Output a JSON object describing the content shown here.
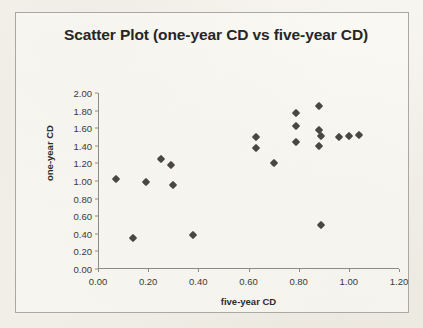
{
  "chart_data": {
    "type": "scatter",
    "title": "Scatter Plot (one-year CD vs five-year CD)",
    "xlabel": "five-year CD",
    "ylabel": "one-year CD",
    "xlim": [
      0.0,
      1.2
    ],
    "ylim": [
      0.0,
      2.0
    ],
    "xticks": [
      "0.00",
      "0.20",
      "0.40",
      "0.60",
      "0.80",
      "1.00",
      "1.20"
    ],
    "xtick_values": [
      0.0,
      0.2,
      0.4,
      0.6,
      0.8,
      1.0,
      1.2
    ],
    "yticks": [
      "0.00",
      "0.20",
      "0.40",
      "0.60",
      "0.80",
      "1.00",
      "1.20",
      "1.40",
      "1.60",
      "1.80",
      "2.00"
    ],
    "ytick_values": [
      0.0,
      0.2,
      0.4,
      0.6,
      0.8,
      1.0,
      1.2,
      1.4,
      1.6,
      1.8,
      2.0
    ],
    "grid": false,
    "legend": false,
    "marker_shape": "diamond",
    "marker_color": "#4a4740",
    "series": [
      {
        "name": "one-year CD vs five-year CD",
        "points": [
          {
            "x": 0.07,
            "y": 1.02
          },
          {
            "x": 0.14,
            "y": 0.35
          },
          {
            "x": 0.19,
            "y": 0.99
          },
          {
            "x": 0.25,
            "y": 1.25
          },
          {
            "x": 0.29,
            "y": 1.18
          },
          {
            "x": 0.3,
            "y": 0.95
          },
          {
            "x": 0.38,
            "y": 0.39
          },
          {
            "x": 0.63,
            "y": 1.5
          },
          {
            "x": 0.63,
            "y": 1.37
          },
          {
            "x": 0.7,
            "y": 1.21
          },
          {
            "x": 0.79,
            "y": 1.77
          },
          {
            "x": 0.79,
            "y": 1.62
          },
          {
            "x": 0.79,
            "y": 1.44
          },
          {
            "x": 0.88,
            "y": 1.85
          },
          {
            "x": 0.88,
            "y": 1.58
          },
          {
            "x": 0.89,
            "y": 1.51
          },
          {
            "x": 0.88,
            "y": 1.4
          },
          {
            "x": 0.89,
            "y": 0.5
          },
          {
            "x": 0.96,
            "y": 1.5
          },
          {
            "x": 1.0,
            "y": 1.51
          },
          {
            "x": 1.04,
            "y": 1.52
          }
        ]
      }
    ]
  }
}
